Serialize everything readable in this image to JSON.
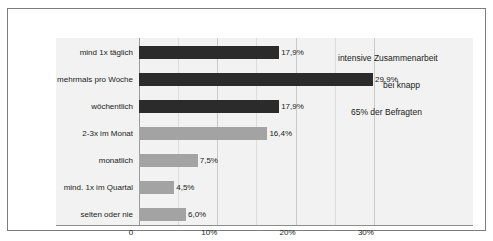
{
  "chart_data": {
    "type": "bar",
    "orientation": "horizontal",
    "title": "",
    "xlabel": "",
    "ylabel": "",
    "xlim": [
      0,
      33.5
    ],
    "grid": true,
    "legend": "none",
    "categories": [
      "mind 1x täglich",
      "mehrmals pro Woche",
      "wöchentlich",
      "2-3x im Monat",
      "monatlich",
      "mind. 1x im Quartal",
      "selten oder nie"
    ],
    "values": [
      17.9,
      29.9,
      17.9,
      16.4,
      7.5,
      4.5,
      6.0
    ],
    "value_labels": [
      "17,9%",
      "29,9%",
      "17,9%",
      "16,4%",
      "7,5%",
      "4,5%",
      "6,0%"
    ],
    "bar_colors": [
      "#2b2b2b",
      "#2b2b2b",
      "#2b2b2b",
      "#a3a3a3",
      "#a3a3a3",
      "#a3a3a3",
      "#a3a3a3"
    ],
    "xticks": [
      0,
      10,
      20,
      30
    ],
    "xtick_labels": [
      "0",
      "10%",
      "20%",
      "30%"
    ]
  },
  "annotations": [
    {
      "text": "intensive Zusammenarbeit"
    },
    {
      "text": "bei knapp"
    },
    {
      "text": "65% der Befragten"
    }
  ],
  "colors": {
    "plot_background": "#f2f2f2",
    "figure_background": "#ffffff",
    "frame": "#7d7d7d",
    "gridline": "#c9c9c9",
    "bar_dark": "#2b2b2b",
    "bar_light": "#a3a3a3",
    "text": "#1a1a1a"
  }
}
